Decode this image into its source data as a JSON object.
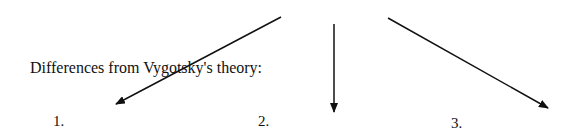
{
  "diagram": {
    "heading": "Differences from Vygotsky's theory:",
    "labels": [
      "1.",
      "2.",
      "3."
    ],
    "arrows": [
      {
        "x1": 281,
        "y1": 17,
        "x2": 116,
        "y2": 104
      },
      {
        "x1": 334,
        "y1": 24,
        "x2": 334,
        "y2": 112
      },
      {
        "x1": 388,
        "y1": 18,
        "x2": 548,
        "y2": 108
      }
    ],
    "colors": {
      "arrow": "#111111",
      "text": "#111111",
      "background": "#ffffff"
    }
  }
}
